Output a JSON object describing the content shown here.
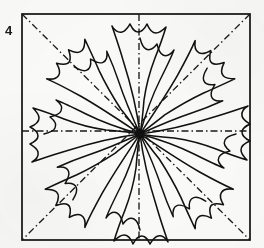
{
  "figure": {
    "label": "4",
    "caption_text": "4",
    "type": "line-drawing",
    "background_color": "#fbfbf9",
    "ink_color": "#111111",
    "fold_line_color": "#1a1a1a",
    "frame": {
      "x": 22,
      "y": 14,
      "width": 228,
      "height": 226,
      "stroke_width": 1.6
    },
    "center": {
      "x": 140,
      "y": 134
    },
    "fold_lines": [
      {
        "name": "diagonal-tl-br",
        "style": "dash-dot",
        "x1": 22,
        "y1": 14,
        "x2": 250,
        "y2": 240
      },
      {
        "name": "diagonal-tr-bl",
        "style": "dash-dot",
        "x1": 250,
        "y1": 14,
        "x2": 22,
        "y2": 240
      },
      {
        "name": "midline-horizontal",
        "style": "dash-dot",
        "x1": 22,
        "y1": 131,
        "x2": 250,
        "y2": 131
      },
      {
        "name": "midline-vertical",
        "style": "dash-dot",
        "x1": 139,
        "y1": 14,
        "x2": 139,
        "y2": 240
      }
    ],
    "petal_count": 8,
    "petals": [
      {
        "name": "petal-n",
        "angle_deg": 270,
        "tip_x": 139,
        "tip_y": 20
      },
      {
        "name": "petal-ne",
        "angle_deg": 315,
        "tip_x": 222,
        "tip_y": 52
      },
      {
        "name": "petal-e",
        "angle_deg": 0,
        "tip_x": 246,
        "tip_y": 131
      },
      {
        "name": "petal-se",
        "angle_deg": 45,
        "tip_x": 224,
        "tip_y": 213
      },
      {
        "name": "petal-s",
        "angle_deg": 90,
        "tip_x": 139,
        "tip_y": 235
      },
      {
        "name": "petal-sw",
        "angle_deg": 135,
        "tip_x": 57,
        "tip_y": 212
      },
      {
        "name": "petal-w",
        "angle_deg": 180,
        "tip_x": 36,
        "tip_y": 131
      },
      {
        "name": "petal-nw",
        "angle_deg": 225,
        "tip_x": 60,
        "tip_y": 52
      }
    ]
  }
}
